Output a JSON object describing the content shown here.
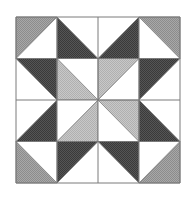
{
  "figure": {
    "grid": {
      "rows": 4,
      "cols": 4,
      "x0": 16,
      "y0": 17,
      "cell_w": 41,
      "cell_h": 41.5
    },
    "colors": {
      "background": "#ffffff",
      "white": "#ffffff",
      "dark": "#4a4a4a",
      "medium": "#9a9a9a",
      "light": "#bdbdbd",
      "line": "#7a7a7a"
    },
    "cells": [
      {
        "row": 0,
        "col": 0,
        "corner": "TL",
        "shade": "medium"
      },
      {
        "row": 0,
        "col": 1,
        "corner": "BL",
        "shade": "dark"
      },
      {
        "row": 0,
        "col": 2,
        "corner": "BR",
        "shade": "dark"
      },
      {
        "row": 0,
        "col": 3,
        "corner": "TR",
        "shade": "medium"
      },
      {
        "row": 1,
        "col": 0,
        "corner": "TR",
        "shade": "dark"
      },
      {
        "row": 1,
        "col": 1,
        "corner": "BL",
        "shade": "light"
      },
      {
        "row": 1,
        "col": 2,
        "corner": "TL",
        "shade": "light"
      },
      {
        "row": 1,
        "col": 3,
        "corner": "TL",
        "shade": "dark"
      },
      {
        "row": 2,
        "col": 0,
        "corner": "BR",
        "shade": "dark"
      },
      {
        "row": 2,
        "col": 1,
        "corner": "BR",
        "shade": "light"
      },
      {
        "row": 2,
        "col": 2,
        "corner": "TR",
        "shade": "light"
      },
      {
        "row": 2,
        "col": 3,
        "corner": "BL",
        "shade": "dark"
      },
      {
        "row": 3,
        "col": 0,
        "corner": "BL",
        "shade": "medium"
      },
      {
        "row": 3,
        "col": 1,
        "corner": "TL",
        "shade": "dark"
      },
      {
        "row": 3,
        "col": 2,
        "corner": "TR",
        "shade": "dark"
      },
      {
        "row": 3,
        "col": 3,
        "corner": "BR",
        "shade": "medium"
      }
    ]
  }
}
